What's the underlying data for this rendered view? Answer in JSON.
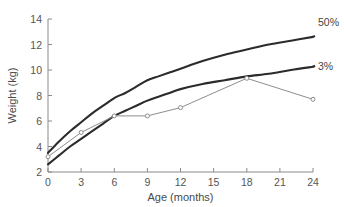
{
  "chart_data": {
    "type": "line",
    "title": "",
    "xlabel": "Age (months)",
    "ylabel": "Weight (kg)",
    "xlim": [
      0,
      24
    ],
    "ylim": [
      2,
      14
    ],
    "xticks": [
      0,
      3,
      6,
      9,
      12,
      15,
      18,
      21,
      24
    ],
    "yticks": [
      2,
      4,
      6,
      8,
      10,
      12,
      14
    ],
    "xtick_labels": [
      "0",
      "3",
      "6",
      "9",
      "12",
      "15",
      "18",
      "21",
      "24"
    ],
    "ytick_labels": [
      "2",
      "4",
      "6",
      "8",
      "10",
      "12",
      "14"
    ],
    "grid": false,
    "legend_position": "right-inline-labels",
    "series": [
      {
        "name": "50%",
        "label": "50%",
        "style": "smooth-thick-dark",
        "color": "#2b2b2b",
        "x": [
          0,
          1,
          2,
          3,
          4,
          5,
          6,
          7,
          8,
          9,
          10,
          11,
          12,
          14,
          16,
          18,
          20,
          22,
          24
        ],
        "values": [
          3.5,
          4.4,
          5.2,
          5.9,
          6.6,
          7.2,
          7.8,
          8.2,
          8.7,
          9.2,
          9.5,
          9.8,
          10.1,
          10.7,
          11.2,
          11.6,
          12.0,
          12.3,
          12.6
        ]
      },
      {
        "name": "3%",
        "label": "3%",
        "style": "smooth-thick-dark",
        "color": "#2b2b2b",
        "x": [
          0,
          1,
          2,
          3,
          4,
          5,
          6,
          7,
          8,
          9,
          10,
          11,
          12,
          14,
          16,
          18,
          20,
          22,
          24
        ],
        "values": [
          2.6,
          3.3,
          4.0,
          4.6,
          5.2,
          5.8,
          6.4,
          6.8,
          7.2,
          7.6,
          7.9,
          8.2,
          8.5,
          8.9,
          9.2,
          9.5,
          9.7,
          10.0,
          10.25
        ]
      },
      {
        "name": "patient",
        "label": "",
        "style": "thin-gray-with-open-circle-markers",
        "color": "#8d8d8d",
        "x": [
          0,
          3,
          6,
          9,
          12,
          18,
          24
        ],
        "values": [
          3.2,
          5.1,
          6.4,
          6.4,
          7.05,
          9.35,
          7.7
        ]
      }
    ]
  }
}
